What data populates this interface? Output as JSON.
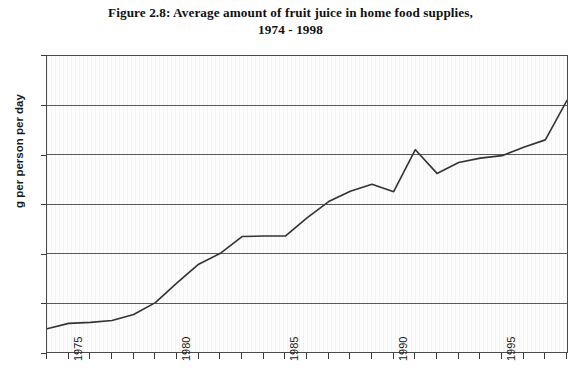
{
  "figure": {
    "title_line1": "Figure 2.8: Average amount of fruit juice in home food supplies,",
    "title_line2": "1974 - 1998"
  },
  "axes": {
    "y_title": "g per person per day",
    "y_ticks": [
      "0",
      "10",
      "20",
      "30",
      "40",
      "50",
      "60"
    ],
    "x_ticks_labeled": [
      "1975",
      "1980",
      "1985",
      "1990",
      "1995"
    ]
  },
  "style": {
    "line_color": "#333333",
    "grid_color": "#5a5a5a",
    "frame_color": "#4a4a4a",
    "plot_background": "#fcfcfc"
  },
  "chart_data": {
    "type": "line",
    "title": "Figure 2.8: Average amount of fruit juice in home food supplies, 1974 - 1998",
    "xlabel": "",
    "ylabel": "g per person per day",
    "xlim": [
      1974,
      1998
    ],
    "ylim": [
      0,
      60
    ],
    "ytick_step": 10,
    "grid": "horizontal",
    "legend": "none",
    "x": [
      1974,
      1975,
      1976,
      1977,
      1978,
      1979,
      1980,
      1981,
      1982,
      1983,
      1984,
      1985,
      1986,
      1987,
      1988,
      1989,
      1990,
      1991,
      1992,
      1993,
      1994,
      1995,
      1996,
      1997,
      1998
    ],
    "series": [
      {
        "name": "Fruit juice",
        "values": [
          4.7,
          5.8,
          6.0,
          6.4,
          7.6,
          10.0,
          14.0,
          17.8,
          20.0,
          23.4,
          23.5,
          23.5,
          27.2,
          30.5,
          32.6,
          34.0,
          32.5,
          41.0,
          36.2,
          38.4,
          39.3,
          39.8,
          41.5,
          43.0,
          51.0
        ]
      }
    ]
  }
}
